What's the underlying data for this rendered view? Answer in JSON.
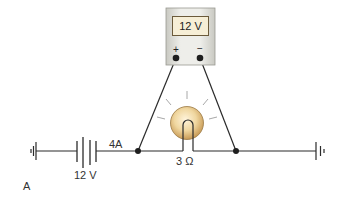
{
  "diagram": {
    "type": "electrical-circuit",
    "panel_label": "A",
    "voltmeter": {
      "reading": "12 V",
      "positive_terminal": "+",
      "negative_terminal": "−"
    },
    "battery": {
      "label": "12 V"
    },
    "current": {
      "label": "4A"
    },
    "lamp": {
      "resistance_label": "3 Ω"
    },
    "colors": {
      "wire": "#2b2b2b",
      "meter_body": "#dcdcd6",
      "meter_border": "#9a9a92",
      "display_bg": "#f6eed6",
      "bulb_outer": "#c8a060",
      "bulb_inner": "#f5e2b8",
      "rays": "#a8a8a8"
    }
  }
}
